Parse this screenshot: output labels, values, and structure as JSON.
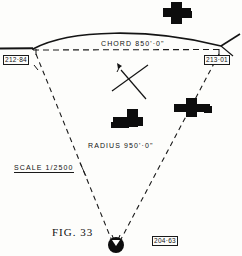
{
  "figure": {
    "caption": "FIG. 33",
    "background_color": "#fdfdfb",
    "ink_color": "#121212",
    "annotations": {
      "chord": "CHORD  850'·0\"",
      "radius": "RADIUS  950'·0\"",
      "scale": "SCALE  1/2500"
    },
    "station_labels": [
      {
        "id": "left-tangent-point",
        "value": "212·84"
      },
      {
        "id": "right-tangent-point",
        "value": "213·01"
      },
      {
        "id": "curve-centre",
        "value": "204·63"
      }
    ],
    "symbols": {
      "north-arrow": "north-arrow-icon",
      "centre-point": "centre-point-icon",
      "buildings": [
        {
          "id": "building-top-right"
        },
        {
          "id": "building-centre"
        },
        {
          "id": "building-right"
        }
      ]
    }
  }
}
